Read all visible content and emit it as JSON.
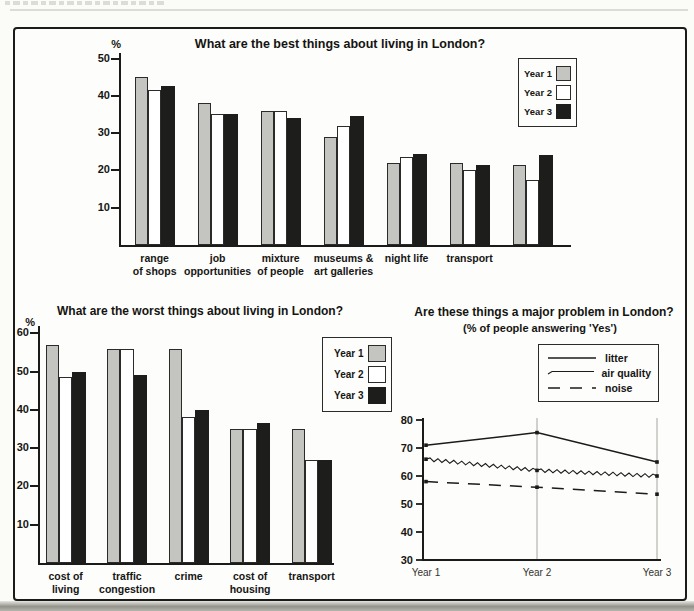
{
  "colors": {
    "year1_fill": "#c4c4c1",
    "year2_fill": "#ffffff",
    "year3_fill": "#1d1d1b",
    "ink": "#1b1b19",
    "gridline": "#9a9a94"
  },
  "chart_data": [
    {
      "id": "best",
      "type": "bar",
      "title": "What are the best things about living in London?",
      "ylabel": "%",
      "ylim": [
        0,
        50
      ],
      "yticks": [
        10,
        20,
        30,
        40,
        50
      ],
      "grid": false,
      "legend_position": "top-right",
      "categories": [
        "range\nof shops",
        "job\nopportunities",
        "mixture\nof people",
        "museums &\nart galleries",
        "night life",
        "transport",
        ""
      ],
      "series": [
        {
          "name": "Year 1",
          "color": "#c4c4c1",
          "values": [
            45,
            38,
            36,
            29,
            22,
            22,
            21.5
          ]
        },
        {
          "name": "Year 2",
          "color": "#ffffff",
          "values": [
            41.5,
            35,
            36,
            32,
            23.5,
            20,
            17.5
          ]
        },
        {
          "name": "Year 3",
          "color": "#1d1d1b",
          "values": [
            42.5,
            35,
            34,
            34.5,
            24.5,
            21.5,
            24
          ]
        }
      ]
    },
    {
      "id": "worst",
      "type": "bar",
      "title": "What are the worst things about living in London?",
      "ylabel": "%",
      "ylim": [
        0,
        60
      ],
      "yticks": [
        10,
        20,
        30,
        40,
        50,
        60
      ],
      "grid": false,
      "legend_position": "right",
      "categories": [
        "cost of\nliving",
        "traffic\ncongestion",
        "crime",
        "cost of\nhousing",
        "transport"
      ],
      "series": [
        {
          "name": "Year 1",
          "color": "#c4c4c1",
          "values": [
            57,
            56,
            56,
            35,
            35
          ]
        },
        {
          "name": "Year 2",
          "color": "#ffffff",
          "values": [
            48.5,
            56,
            38,
            35,
            27
          ]
        },
        {
          "name": "Year 3",
          "color": "#1d1d1b",
          "values": [
            50,
            49,
            40,
            36.5,
            27
          ]
        }
      ]
    },
    {
      "id": "problems",
      "type": "line",
      "title": "Are these things a major problem in London?",
      "subtitle": "(% of people answering 'Yes')",
      "ylim": [
        30,
        80
      ],
      "yticks": [
        30,
        40,
        50,
        60,
        70,
        80
      ],
      "x_categories": [
        "Year 1",
        "Year 2",
        "Year 3"
      ],
      "grid": "vertical-at-x",
      "legend_position": "top-right",
      "series": [
        {
          "name": "litter",
          "style": "solid",
          "values": [
            71,
            75.5,
            65
          ]
        },
        {
          "name": "air quality",
          "style": "zigzag",
          "values": [
            66,
            62,
            60
          ]
        },
        {
          "name": "noise",
          "style": "dashed",
          "values": [
            58,
            56,
            53.5
          ]
        }
      ]
    }
  ]
}
